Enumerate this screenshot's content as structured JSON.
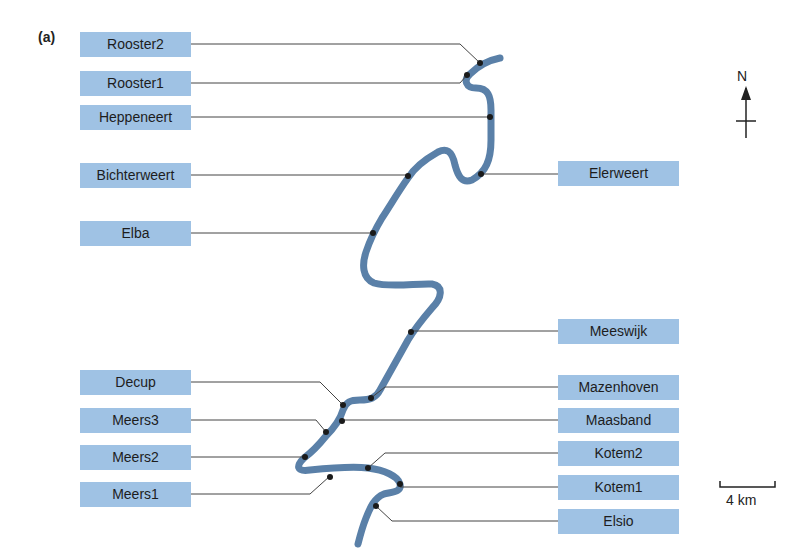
{
  "figure": {
    "panel_label": "(a)",
    "north_label": "N",
    "scale_label": "4 km",
    "river_color": "#5a80a8",
    "box_color": "#9fc2e4"
  },
  "left_sites": [
    {
      "label": "Rooster2",
      "y": 44
    },
    {
      "label": "Rooster1",
      "y": 83
    },
    {
      "label": "Heppeneert",
      "y": 117
    },
    {
      "label": "Bichterweert",
      "y": 175
    },
    {
      "label": "Elba",
      "y": 233
    },
    {
      "label": "Decup",
      "y": 382
    },
    {
      "label": "Meers3",
      "y": 420
    },
    {
      "label": "Meers2",
      "y": 457
    },
    {
      "label": "Meers1",
      "y": 494
    }
  ],
  "right_sites": [
    {
      "label": "Elerweert",
      "y": 174
    },
    {
      "label": "Meeswijk",
      "y": 331
    },
    {
      "label": "Mazenhoven",
      "y": 387
    },
    {
      "label": "Maasband",
      "y": 420
    },
    {
      "label": "Kotem2",
      "y": 453
    },
    {
      "label": "Kotem1",
      "y": 487
    },
    {
      "label": "Elsio",
      "y": 521
    }
  ]
}
